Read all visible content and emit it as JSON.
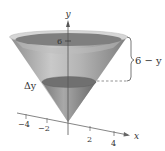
{
  "figure": {
    "type": "3d-cone-diagram",
    "axes": {
      "y_label": "y",
      "x_label": "x",
      "x_ticks": [
        "−4",
        "−2",
        "2",
        "4"
      ],
      "y_ticks": [
        "6"
      ]
    },
    "annotations": {
      "height_label": "6 − y",
      "slice_label": "Δy"
    },
    "colors": {
      "cone_fill": "#9a9a9a",
      "cone_light": "#c8c8c8",
      "top_disk": "#7d7d7d",
      "rim": "#d9d9d9",
      "slice_disk": "#6f6f6f",
      "axis": "#555555"
    }
  }
}
